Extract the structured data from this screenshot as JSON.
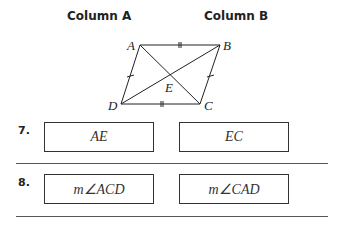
{
  "headers": {
    "column_a": "Column A",
    "column_b": "Column B"
  },
  "diagram": {
    "vertices": [
      "A",
      "B",
      "C",
      "D"
    ],
    "intersection": "E"
  },
  "questions": [
    {
      "number": "7.",
      "column_a": "AE",
      "column_b": "EC"
    },
    {
      "number": "8.",
      "column_a": "m∠ACD",
      "column_b": "m∠CAD"
    }
  ]
}
